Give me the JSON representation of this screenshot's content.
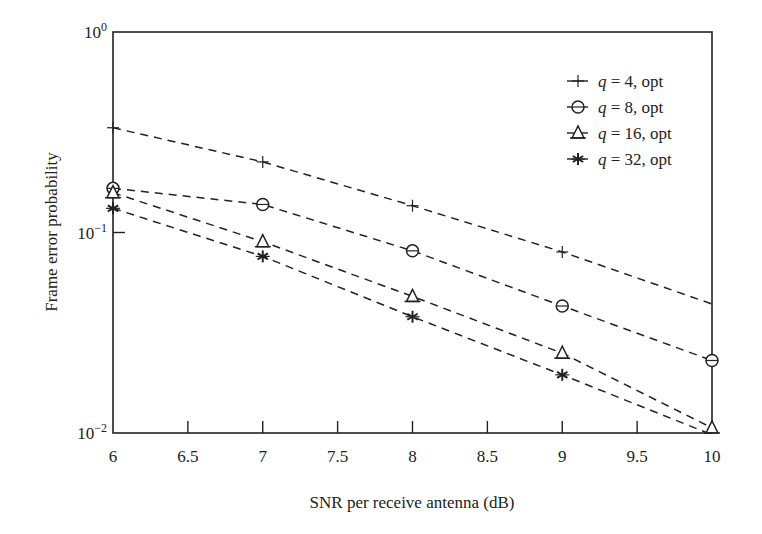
{
  "chart_data": {
    "type": "line",
    "title": "",
    "xlabel": "SNR per receive antenna (dB)",
    "ylabel": "Frame error probability",
    "yscale": "log",
    "xlim": [
      6,
      10
    ],
    "ylim": [
      0.01,
      1
    ],
    "x_ticks": [
      "6",
      "6.5",
      "7",
      "7.5",
      "8",
      "8.5",
      "9",
      "9.5",
      "10"
    ],
    "y_ticks": [
      {
        "base": "10",
        "exp": "0",
        "value": 1
      },
      {
        "base": "10",
        "exp": "−1",
        "value": 0.1
      },
      {
        "base": "10",
        "exp": "−2",
        "value": 0.01
      }
    ],
    "grid": false,
    "legend_position": "upper right",
    "x": [
      6,
      7,
      8,
      9,
      10
    ],
    "series": [
      {
        "name": "q = 4, opt",
        "q": "4",
        "marker": "plus",
        "values": [
          0.333,
          0.225,
          0.136,
          0.08,
          0.044
        ],
        "marker_mask": [
          1,
          1,
          1,
          1,
          0
        ]
      },
      {
        "name": "q = 8, opt",
        "q": "8",
        "marker": "circle",
        "values": [
          0.166,
          0.138,
          0.081,
          0.043,
          0.023
        ],
        "marker_mask": [
          1,
          1,
          1,
          1,
          1
        ]
      },
      {
        "name": "q = 16, opt",
        "q": "16",
        "marker": "triangle",
        "values": [
          0.158,
          0.09,
          0.048,
          0.025,
          0.0106
        ],
        "marker_mask": [
          1,
          1,
          1,
          1,
          1
        ]
      },
      {
        "name": "q = 32, opt",
        "q": "32",
        "marker": "asterisk",
        "values": [
          0.132,
          0.076,
          0.038,
          0.0195,
          0.0098
        ],
        "marker_mask": [
          1,
          1,
          1,
          1,
          0
        ]
      }
    ]
  },
  "legend": {
    "items": [
      {
        "q": "q",
        "text": " = 4, opt"
      },
      {
        "q": "q",
        "text": " = 8, opt"
      },
      {
        "q": "q",
        "text": " = 16, opt"
      },
      {
        "q": "q",
        "text": " = 32, opt"
      }
    ]
  }
}
